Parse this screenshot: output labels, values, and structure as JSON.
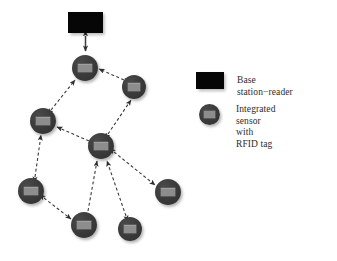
{
  "figure": {
    "background_color": "#ffffff",
    "node_color": "#3b3b3b",
    "tag_color": "#8d8d8d",
    "base_station_color": "#060606",
    "edge_color": "#3a3a3a",
    "edge_style": "dashed"
  },
  "base_station": {
    "name": "base-station-reader",
    "x": 68,
    "y": 12,
    "width": 35,
    "height": 21
  },
  "nodes": [
    {
      "id": "n1",
      "label": "",
      "cx": 85,
      "cy": 68,
      "r": 13
    },
    {
      "id": "n2",
      "label": "",
      "cx": 134,
      "cy": 87,
      "r": 12
    },
    {
      "id": "n3",
      "label": "",
      "cx": 43,
      "cy": 121,
      "r": 13
    },
    {
      "id": "n4",
      "label": "",
      "cx": 101,
      "cy": 146,
      "r": 13
    },
    {
      "id": "n5",
      "label": "",
      "cx": 31,
      "cy": 191,
      "r": 13
    },
    {
      "id": "n6",
      "label": "",
      "cx": 84,
      "cy": 225,
      "r": 13
    },
    {
      "id": "n7",
      "label": "",
      "cx": 130,
      "cy": 229,
      "r": 12
    },
    {
      "id": "n8",
      "label": "",
      "cx": 168,
      "cy": 192,
      "r": 13
    }
  ],
  "edges": [
    {
      "from": "base_station",
      "to": "n1",
      "arrows": "both"
    },
    {
      "from": "n3",
      "to": "n1",
      "arrows": "both"
    },
    {
      "from": "n2",
      "to": "n1",
      "arrows": "both"
    },
    {
      "from": "n4",
      "to": "n2",
      "arrows": "both"
    },
    {
      "from": "n4",
      "to": "n3",
      "arrows": "both"
    },
    {
      "from": "n5",
      "to": "n3",
      "arrows": "both"
    },
    {
      "from": "n5",
      "to": "n6",
      "arrows": "both"
    },
    {
      "from": "n6",
      "to": "n4",
      "arrows": "forward"
    },
    {
      "from": "n7",
      "to": "n4",
      "arrows": "both"
    },
    {
      "from": "n4",
      "to": "n8",
      "arrows": "both"
    }
  ],
  "legend": {
    "name": "diagram-legend",
    "items": [
      {
        "symbol": "black-rectangle",
        "label": "Base station−reader",
        "x": 196,
        "y": 72
      },
      {
        "symbol": "gray-circle-with-tag",
        "label": "Integrated sensor\nwith RFID tag",
        "x": 199,
        "y": 104
      }
    ]
  }
}
